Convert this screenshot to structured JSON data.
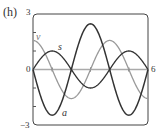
{
  "panel_label": "(h)",
  "chart_data": {
    "type": "line",
    "title": "",
    "xlabel": "",
    "ylabel": "",
    "xlim": [
      0,
      6
    ],
    "ylim": [
      -3,
      3
    ],
    "x_tick_labels": [
      "0",
      "6"
    ],
    "y_tick_labels": [
      "3",
      "0",
      "-3"
    ],
    "grid": false,
    "legend": "inline curve labels",
    "series": [
      {
        "name": "s",
        "color": "#333333",
        "formula": "sin(pi*x/2)",
        "x": [
          0,
          1,
          2,
          3,
          4,
          5,
          6
        ],
        "values": [
          0,
          1,
          0,
          -1,
          0,
          1,
          0
        ]
      },
      {
        "name": "v",
        "color": "#999999",
        "formula": "(pi/2)*cos(pi*x/2)",
        "x": [
          0,
          1,
          2,
          3,
          4,
          5,
          6
        ],
        "values": [
          1.57,
          0,
          -1.57,
          0,
          1.57,
          0,
          -1.57
        ]
      },
      {
        "name": "a",
        "color": "#333333",
        "formula": "-(pi/2)^2*sin(pi*x/2)",
        "x": [
          0,
          1,
          2,
          3,
          4,
          5,
          6
        ],
        "values": [
          0,
          -2.47,
          0,
          2.47,
          0,
          -2.47,
          0
        ]
      }
    ]
  },
  "labels": {
    "y_max": "3",
    "y_zero": "0",
    "y_min": "−3",
    "x_max": "6",
    "curve_s": "s",
    "curve_v": "v",
    "curve_a": "a"
  }
}
